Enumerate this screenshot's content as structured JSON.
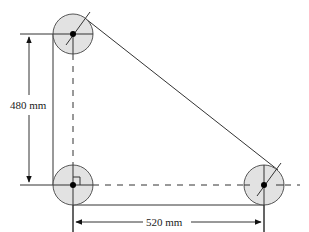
{
  "diagram": {
    "type": "belt-pulley-system",
    "colors": {
      "line": "#333333",
      "pulley_fill": "#e2e2e2",
      "pulley_stroke": "#555555",
      "center_dot": "#000000",
      "background": "#ffffff"
    },
    "pulleys": [
      {
        "id": "top-left",
        "cx": 73,
        "cy": 34,
        "r": 20
      },
      {
        "id": "bottom-left",
        "cx": 73,
        "cy": 185,
        "r": 20
      },
      {
        "id": "bottom-right",
        "cx": 264,
        "cy": 185,
        "r": 20
      }
    ],
    "dimensions": {
      "vertical": {
        "label": "480 mm"
      },
      "horizontal": {
        "label": "520 mm"
      }
    },
    "annotations": {
      "right_angle_marker": true
    }
  }
}
